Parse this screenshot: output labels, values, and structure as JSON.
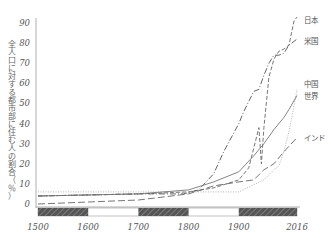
{
  "chart_data": {
    "type": "line",
    "title": "",
    "xlabel": "",
    "ylabel": "全人口に対する都市部に住む人の割合（％）",
    "xlim": [
      1500,
      2016
    ],
    "ylim": [
      0,
      90
    ],
    "x_ticks": [
      "1500",
      "1600",
      "1700",
      "1800",
      "1900",
      "2016"
    ],
    "y_ticks": [
      "0",
      "10",
      "20",
      "30",
      "40",
      "50",
      "60",
      "70",
      "80",
      "90"
    ],
    "grid": false,
    "legend_position": "inline-right",
    "series": [
      {
        "name": "日本",
        "style": "dashed",
        "points": [
          [
            1500,
            4
          ],
          [
            1700,
            5
          ],
          [
            1800,
            6
          ],
          [
            1850,
            8
          ],
          [
            1900,
            12
          ],
          [
            1920,
            18
          ],
          [
            1940,
            38
          ],
          [
            1945,
            20
          ],
          [
            1950,
            38
          ],
          [
            1960,
            63
          ],
          [
            1970,
            72
          ],
          [
            1980,
            76
          ],
          [
            1990,
            77
          ],
          [
            2000,
            79
          ],
          [
            2010,
            91
          ],
          [
            2016,
            93
          ]
        ]
      },
      {
        "name": "米国",
        "style": "dash-dot",
        "points": [
          [
            1500,
            4
          ],
          [
            1700,
            5
          ],
          [
            1790,
            5
          ],
          [
            1820,
            7
          ],
          [
            1850,
            15
          ],
          [
            1870,
            26
          ],
          [
            1900,
            40
          ],
          [
            1910,
            46
          ],
          [
            1920,
            51
          ],
          [
            1930,
            56
          ],
          [
            1940,
            57
          ],
          [
            1950,
            64
          ],
          [
            1960,
            70
          ],
          [
            1970,
            74
          ],
          [
            1980,
            74
          ],
          [
            1990,
            75
          ],
          [
            2000,
            79
          ],
          [
            2016,
            82
          ]
        ]
      },
      {
        "name": "中国",
        "style": "dotted",
        "points": [
          [
            1500,
            6
          ],
          [
            1700,
            6
          ],
          [
            1800,
            6
          ],
          [
            1900,
            6
          ],
          [
            1950,
            12
          ],
          [
            1970,
            17
          ],
          [
            1980,
            19
          ],
          [
            1990,
            26
          ],
          [
            2000,
            36
          ],
          [
            2010,
            49
          ],
          [
            2016,
            57
          ]
        ]
      },
      {
        "name": "世界",
        "style": "solid",
        "points": [
          [
            1500,
            4
          ],
          [
            1700,
            5
          ],
          [
            1800,
            7
          ],
          [
            1850,
            11
          ],
          [
            1900,
            16
          ],
          [
            1930,
            24
          ],
          [
            1950,
            30
          ],
          [
            1970,
            37
          ],
          [
            1990,
            43
          ],
          [
            2000,
            47
          ],
          [
            2016,
            54
          ]
        ]
      },
      {
        "name": "インド",
        "style": "long-dash",
        "points": [
          [
            1500,
            0
          ],
          [
            1600,
            1
          ],
          [
            1700,
            2
          ],
          [
            1800,
            5
          ],
          [
            1850,
            9
          ],
          [
            1900,
            11
          ],
          [
            1930,
            12
          ],
          [
            1950,
            17
          ],
          [
            1970,
            20
          ],
          [
            1990,
            26
          ],
          [
            2016,
            33
          ]
        ]
      }
    ],
    "annotations": [
      "日本",
      "米国",
      "中国",
      "世界",
      "インド"
    ],
    "timeline_bar": {
      "shaded_segments": [
        [
          1500,
          1600
        ],
        [
          1700,
          1800
        ],
        [
          1900,
          2016
        ]
      ]
    }
  }
}
